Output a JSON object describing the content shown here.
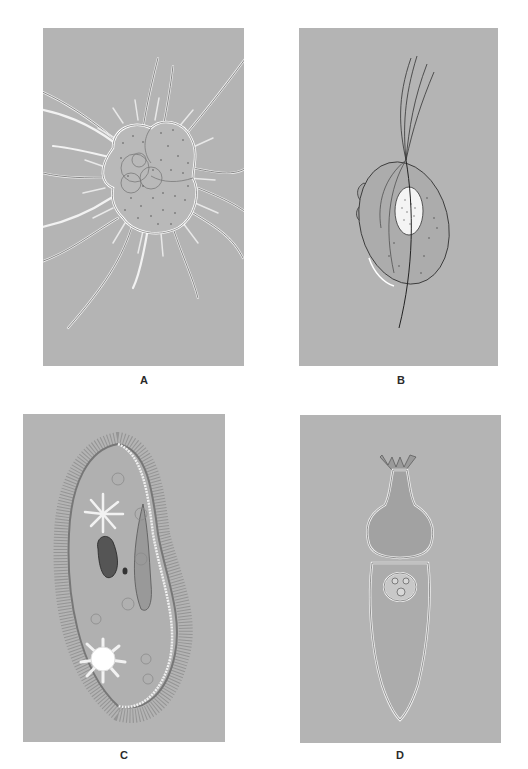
{
  "figure": {
    "background_color": "#ffffff",
    "panel_color": "#b4b4b4",
    "panels": [
      {
        "id": "A",
        "label": "A",
        "subject": "radiolarian-like protozoan with radiating pseudopodia (foraminifera-like chambered test)"
      },
      {
        "id": "B",
        "label": "B",
        "subject": "flagellate (trichomonad-like) with undulating membrane and nucleus"
      },
      {
        "id": "C",
        "label": "C",
        "subject": "ciliate (Paramecium) with cilia, macronucleus, micronucleus, contractile vacuoles, oral groove"
      },
      {
        "id": "D",
        "label": "D",
        "subject": "gregarine-like sporozoan with epimerite, protomerite, deutomerite and nucleus"
      }
    ]
  }
}
